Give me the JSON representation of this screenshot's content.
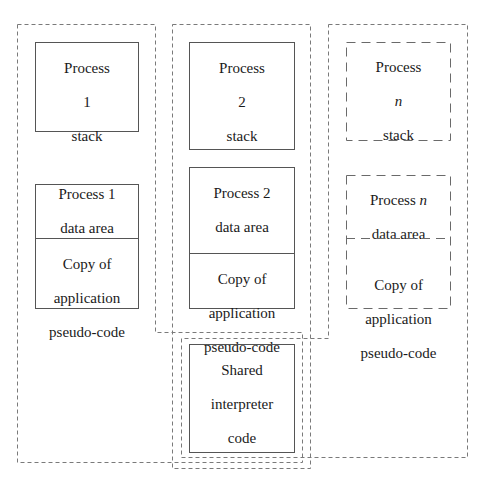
{
  "diagram": {
    "title": "",
    "type": "memory layout of interpreted processes",
    "colors": {
      "solid_border": "#555555",
      "dashed_border": "#6a6a6a",
      "outline_dash": "#777777",
      "text": "#1a1a1a",
      "background": "#ffffff"
    },
    "processes": [
      {
        "id": "1",
        "stack": {
          "line1": "Process",
          "line2": "1",
          "line3": "stack"
        },
        "data_area": {
          "line1": "Process 1",
          "line2": "data area"
        },
        "code_copy": {
          "line1": "Copy of",
          "line2": "application",
          "line3": "pseudo-code"
        },
        "style": "solid"
      },
      {
        "id": "2",
        "stack": {
          "line1": "Process",
          "line2": "2",
          "line3": "stack"
        },
        "data_area": {
          "line1": "Process 2",
          "line2": "data area"
        },
        "code_copy": {
          "line1": "Copy of",
          "line2": "application",
          "line3": "pseudo-code"
        },
        "style": "solid"
      },
      {
        "id": "n",
        "stack": {
          "line1": "Process",
          "line2": "n",
          "line3": "stack"
        },
        "data_area": {
          "line1_prefix": "Process ",
          "line1_var": "n",
          "line2": "data area"
        },
        "code_copy": {
          "line1": "Copy of",
          "line2": "application",
          "line3": "pseudo-code"
        },
        "style": "dashed"
      }
    ],
    "shared": {
      "line1": "Shared",
      "line2": "interpreter",
      "line3": "code"
    }
  }
}
